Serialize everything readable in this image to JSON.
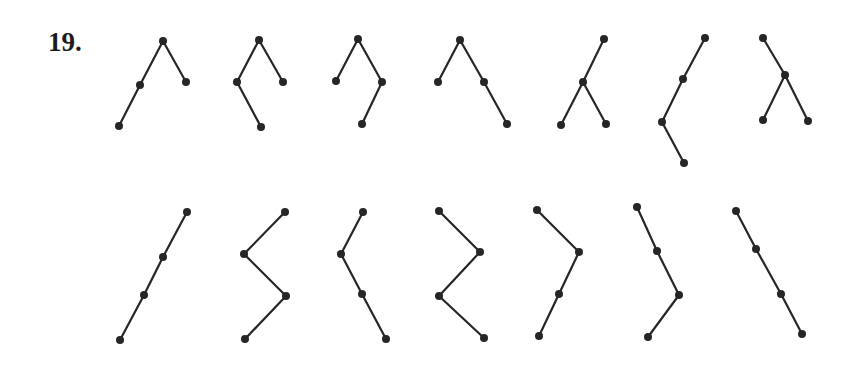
{
  "problem_label": "19.",
  "colors": {
    "ink": "#262626",
    "background": "#ffffff"
  },
  "node_radius": 4,
  "trees": [
    {
      "id": 1,
      "nodes": [
        [
          163,
          41
        ],
        [
          140,
          85
        ],
        [
          186,
          82
        ],
        [
          119,
          126
        ]
      ],
      "edges": [
        [
          0,
          1
        ],
        [
          0,
          2
        ],
        [
          1,
          3
        ]
      ]
    },
    {
      "id": 2,
      "nodes": [
        [
          259,
          40
        ],
        [
          237,
          82
        ],
        [
          283,
          82
        ],
        [
          261,
          127
        ]
      ],
      "edges": [
        [
          0,
          1
        ],
        [
          0,
          2
        ],
        [
          1,
          3
        ]
      ]
    },
    {
      "id": 3,
      "nodes": [
        [
          358,
          39
        ],
        [
          336,
          81
        ],
        [
          382,
          82
        ],
        [
          362,
          124
        ]
      ],
      "edges": [
        [
          0,
          1
        ],
        [
          0,
          2
        ],
        [
          2,
          3
        ]
      ]
    },
    {
      "id": 4,
      "nodes": [
        [
          460,
          40
        ],
        [
          438,
          82
        ],
        [
          484,
          82
        ],
        [
          507,
          124
        ]
      ],
      "edges": [
        [
          0,
          1
        ],
        [
          0,
          2
        ],
        [
          2,
          3
        ]
      ]
    },
    {
      "id": 5,
      "nodes": [
        [
          604,
          39
        ],
        [
          583,
          82
        ],
        [
          561,
          125
        ],
        [
          606,
          124
        ]
      ],
      "edges": [
        [
          0,
          1
        ],
        [
          1,
          2
        ],
        [
          1,
          3
        ]
      ]
    },
    {
      "id": 6,
      "nodes": [
        [
          705,
          38
        ],
        [
          683,
          79
        ],
        [
          662,
          122
        ],
        [
          684,
          163
        ]
      ],
      "edges": [
        [
          0,
          1
        ],
        [
          1,
          2
        ],
        [
          2,
          3
        ]
      ]
    },
    {
      "id": 7,
      "nodes": [
        [
          763,
          38
        ],
        [
          785,
          75
        ],
        [
          763,
          120
        ],
        [
          808,
          121
        ]
      ],
      "edges": [
        [
          0,
          1
        ],
        [
          1,
          2
        ],
        [
          1,
          3
        ]
      ]
    },
    {
      "id": 8,
      "nodes": [
        [
          187,
          212
        ],
        [
          163,
          257
        ],
        [
          144,
          295
        ],
        [
          120,
          340
        ]
      ],
      "edges": [
        [
          0,
          1
        ],
        [
          1,
          2
        ],
        [
          2,
          3
        ]
      ]
    },
    {
      "id": 9,
      "nodes": [
        [
          285,
          212
        ],
        [
          244,
          254
        ],
        [
          286,
          296
        ],
        [
          245,
          339
        ]
      ],
      "edges": [
        [
          0,
          1
        ],
        [
          1,
          2
        ],
        [
          2,
          3
        ]
      ]
    },
    {
      "id": 10,
      "nodes": [
        [
          363,
          212
        ],
        [
          341,
          254
        ],
        [
          362,
          294
        ],
        [
          386,
          339
        ]
      ],
      "edges": [
        [
          0,
          1
        ],
        [
          1,
          2
        ],
        [
          2,
          3
        ]
      ]
    },
    {
      "id": 11,
      "nodes": [
        [
          439,
          211
        ],
        [
          480,
          252
        ],
        [
          439,
          296
        ],
        [
          484,
          338
        ]
      ],
      "edges": [
        [
          0,
          1
        ],
        [
          1,
          2
        ],
        [
          2,
          3
        ]
      ]
    },
    {
      "id": 12,
      "nodes": [
        [
          537,
          210
        ],
        [
          579,
          252
        ],
        [
          559,
          294
        ],
        [
          539,
          336
        ]
      ],
      "edges": [
        [
          0,
          1
        ],
        [
          1,
          2
        ],
        [
          2,
          3
        ]
      ]
    },
    {
      "id": 13,
      "nodes": [
        [
          637,
          207
        ],
        [
          657,
          251
        ],
        [
          679,
          295
        ],
        [
          648,
          337
        ]
      ],
      "edges": [
        [
          0,
          1
        ],
        [
          1,
          2
        ],
        [
          2,
          3
        ]
      ]
    },
    {
      "id": 14,
      "nodes": [
        [
          736,
          211
        ],
        [
          756,
          249
        ],
        [
          781,
          294
        ],
        [
          802,
          334
        ]
      ],
      "edges": [
        [
          0,
          1
        ],
        [
          1,
          2
        ],
        [
          2,
          3
        ]
      ]
    }
  ]
}
